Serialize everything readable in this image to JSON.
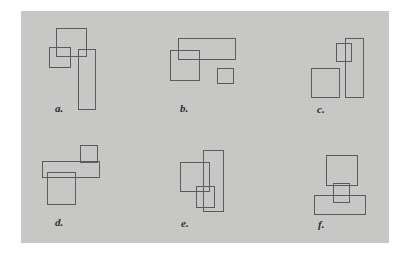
{
  "figure": {
    "canvas": {
      "width": 409,
      "height": 256,
      "background": "#ffffff"
    },
    "plate": {
      "x": 21,
      "y": 11,
      "width": 368,
      "height": 232,
      "background": "#c9c9c7",
      "stroke_color": "#5a5a5c",
      "stroke_width": 1.5,
      "label_color": "#2b2b2d"
    },
    "panels": [
      {
        "id": "a",
        "label": "a.",
        "label_x": 55,
        "label_y": 103,
        "rects": [
          {
            "name": "tall-rect",
            "x": 78,
            "y": 49,
            "w": 18,
            "h": 61
          },
          {
            "name": "top-rect",
            "x": 56,
            "y": 28,
            "w": 31,
            "h": 29
          },
          {
            "name": "small-square",
            "x": 49,
            "y": 47,
            "w": 22,
            "h": 21
          }
        ]
      },
      {
        "id": "b",
        "label": "b.",
        "label_x": 180,
        "label_y": 103,
        "rects": [
          {
            "name": "wide-rect",
            "x": 178,
            "y": 38,
            "w": 58,
            "h": 22
          },
          {
            "name": "left-rect",
            "x": 170,
            "y": 50,
            "w": 30,
            "h": 31
          },
          {
            "name": "small-square",
            "x": 217,
            "y": 68,
            "w": 17,
            "h": 16
          }
        ]
      },
      {
        "id": "c",
        "label": "c.",
        "label_x": 317,
        "label_y": 104,
        "rects": [
          {
            "name": "tall-rect",
            "x": 345,
            "y": 38,
            "w": 19,
            "h": 60
          },
          {
            "name": "small-square",
            "x": 336,
            "y": 43,
            "w": 16,
            "h": 19
          },
          {
            "name": "left-square",
            "x": 311,
            "y": 68,
            "w": 29,
            "h": 30
          }
        ]
      },
      {
        "id": "d",
        "label": "d.",
        "label_x": 55,
        "label_y": 217,
        "rects": [
          {
            "name": "top-right-square",
            "x": 80,
            "y": 145,
            "w": 18,
            "h": 18
          },
          {
            "name": "wide-rect",
            "x": 42,
            "y": 161,
            "w": 58,
            "h": 17
          },
          {
            "name": "bottom-square",
            "x": 47,
            "y": 172,
            "w": 29,
            "h": 33
          }
        ]
      },
      {
        "id": "e",
        "label": "e.",
        "label_x": 181,
        "label_y": 218,
        "rects": [
          {
            "name": "tall-rect",
            "x": 203,
            "y": 150,
            "w": 21,
            "h": 62
          },
          {
            "name": "left-square",
            "x": 180,
            "y": 162,
            "w": 30,
            "h": 30
          },
          {
            "name": "small-square",
            "x": 196,
            "y": 186,
            "w": 19,
            "h": 22
          }
        ]
      },
      {
        "id": "f",
        "label": "f.",
        "label_x": 318,
        "label_y": 219,
        "rects": [
          {
            "name": "top-square",
            "x": 326,
            "y": 155,
            "w": 32,
            "h": 31
          },
          {
            "name": "wide-rect",
            "x": 314,
            "y": 195,
            "w": 52,
            "h": 20
          },
          {
            "name": "small-square",
            "x": 333,
            "y": 183,
            "w": 17,
            "h": 20
          }
        ]
      }
    ]
  }
}
